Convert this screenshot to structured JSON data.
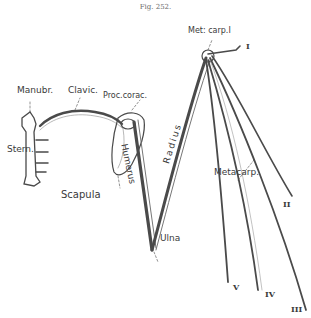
{
  "figure": {
    "title": "Fig. 252.",
    "type": "anatomical line drawing"
  },
  "labels": {
    "metcarp1": "Met: carp.I",
    "digit_I": "I",
    "manubr": "Manubr.",
    "clavic": "Clavic.",
    "proc_corac": "Proc.corac.",
    "stern": "Stern.",
    "scapula": "Scapula",
    "humerus": "Humerus",
    "radius": "Radius",
    "metacarp": "Metacarp.",
    "ulna": "Ulna",
    "digit_II": "II",
    "digit_III": "III",
    "digit_IV": "IV",
    "digit_V": "V"
  },
  "colors": {
    "ink": "#3a3a3a",
    "light_ink": "#8a8a8a",
    "paper": "#ffffff"
  }
}
